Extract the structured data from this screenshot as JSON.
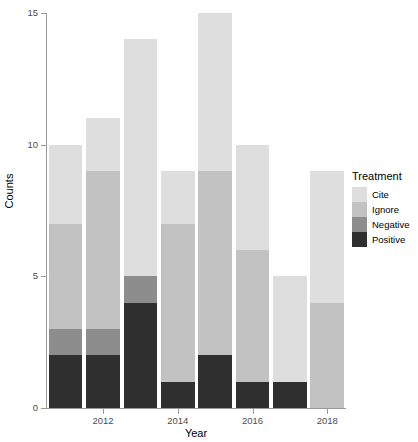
{
  "chart_data": {
    "type": "bar",
    "barmode": "stacked",
    "title": "",
    "xlabel": "Year",
    "ylabel": "Counts",
    "x": [
      2011,
      2012,
      2013,
      2014,
      2015,
      2016,
      2017,
      2018
    ],
    "categories": [
      "2011",
      "2012",
      "2013",
      "2014",
      "2015",
      "2016",
      "2017",
      "2018"
    ],
    "xtick_labels": [
      "2012",
      "2014",
      "2016",
      "2018"
    ],
    "xtick_values": [
      2012,
      2014,
      2016,
      2018
    ],
    "ytick_labels": [
      "0",
      "5",
      "10",
      "15"
    ],
    "ytick_values": [
      0,
      5,
      10,
      15
    ],
    "ylim": [
      0,
      15
    ],
    "grid": false,
    "legend_title": "Treatment",
    "legend_position": "right",
    "stack_order_bottom_to_top": [
      "Positive",
      "Negative",
      "Ignore",
      "Cite"
    ],
    "series": [
      {
        "name": "Cite",
        "color": "#dedede",
        "values": [
          3,
          2,
          9,
          2,
          6,
          4,
          4,
          5
        ]
      },
      {
        "name": "Ignore",
        "color": "#c2c2c2",
        "values": [
          4,
          6,
          0,
          6,
          7,
          5,
          0,
          4
        ]
      },
      {
        "name": "Negative",
        "color": "#8d8d8d",
        "values": [
          1,
          1,
          1,
          0,
          0,
          0,
          0,
          0
        ]
      },
      {
        "name": "Positive",
        "color": "#2f2f2f",
        "values": [
          2,
          2,
          4,
          1,
          2,
          1,
          1,
          0
        ]
      }
    ],
    "totals": [
      10,
      11,
      14,
      9,
      15,
      10,
      5,
      9
    ]
  },
  "legend": {
    "title": "Treatment",
    "items": [
      {
        "label": "Cite",
        "color": "#dedede"
      },
      {
        "label": "Ignore",
        "color": "#c2c2c2"
      },
      {
        "label": "Negative",
        "color": "#8d8d8d"
      },
      {
        "label": "Positive",
        "color": "#2f2f2f"
      }
    ]
  },
  "axes": {
    "x_title": "Year",
    "y_title": "Counts"
  }
}
